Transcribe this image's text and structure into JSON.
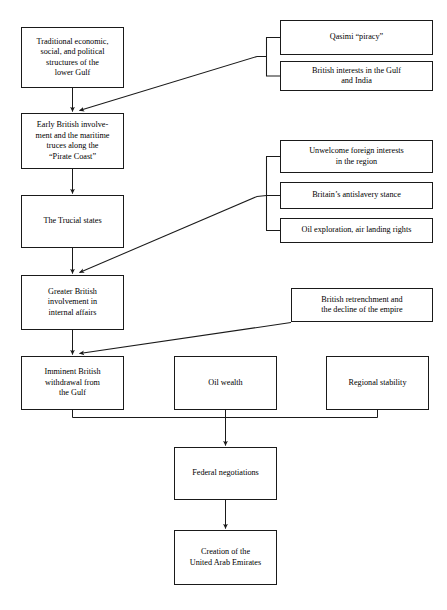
{
  "diagram": {
    "type": "flowchart",
    "background_color": "#ffffff",
    "line_color": "#1a1a1a",
    "text_color": "#000000",
    "nodes": [
      {
        "id": "traditional-structures",
        "label": "Traditional economic,\nsocial, and political\nstructures of the\nlower Gulf",
        "x": 21,
        "y": 27,
        "w": 103,
        "h": 61
      },
      {
        "id": "qasimi-piracy",
        "label": "Qasimi “piracy”",
        "x": 280,
        "y": 20,
        "w": 153,
        "h": 35
      },
      {
        "id": "british-interests",
        "label": "British interests in the Gulf\nand India",
        "x": 280,
        "y": 61,
        "w": 153,
        "h": 30
      },
      {
        "id": "early-british-involvement",
        "label": "Early British involve-\nment and the maritime\ntruces along the\n“Pirate Coast”",
        "x": 21,
        "y": 113,
        "w": 103,
        "h": 56
      },
      {
        "id": "unwelcome-foreign-interests",
        "label": "Unwelcome foreign interests\nin the region",
        "x": 280,
        "y": 140,
        "w": 153,
        "h": 33
      },
      {
        "id": "britain-antislavery",
        "label": "Britain’s antislavery stance",
        "x": 280,
        "y": 182,
        "w": 153,
        "h": 27
      },
      {
        "id": "oil-exploration",
        "label": "Oil exploration, air landing rights",
        "x": 280,
        "y": 218,
        "w": 153,
        "h": 25
      },
      {
        "id": "trucial-states",
        "label": "The Trucial states",
        "x": 21,
        "y": 195,
        "w": 103,
        "h": 53
      },
      {
        "id": "greater-british-involvement",
        "label": "Greater British\ninvolvement in\ninternal affairs",
        "x": 21,
        "y": 275,
        "w": 103,
        "h": 55
      },
      {
        "id": "british-retrenchment",
        "label": "British retrenchment and\nthe decline of the empire",
        "x": 291,
        "y": 288,
        "w": 142,
        "h": 34
      },
      {
        "id": "imminent-withdrawal",
        "label": "Imminent British\nwithdrawal from\nthe Gulf",
        "x": 21,
        "y": 356,
        "w": 103,
        "h": 54
      },
      {
        "id": "oil-wealth",
        "label": "Oil wealth",
        "x": 174,
        "y": 356,
        "w": 103,
        "h": 54
      },
      {
        "id": "regional-stability",
        "label": "Regional stability",
        "x": 326,
        "y": 356,
        "w": 103,
        "h": 54
      },
      {
        "id": "federal-negotiations",
        "label": "Federal negotiations",
        "x": 174,
        "y": 447,
        "w": 103,
        "h": 53
      },
      {
        "id": "creation-uae",
        "label": "Creation of the\nUnited Arab Emirates",
        "x": 174,
        "y": 530,
        "w": 103,
        "h": 55
      }
    ],
    "edges": [
      {
        "id": "traditional-to-early",
        "kind": "vertical-arrow",
        "from": "traditional-structures",
        "to": "early-british-involvement"
      },
      {
        "id": "qasimi-group-to-early",
        "kind": "bracket-diagonal-arrow",
        "from": "qasimi-piracy,british-interests",
        "to": "early-british-involvement"
      },
      {
        "id": "early-to-trucial",
        "kind": "vertical-arrow",
        "from": "early-british-involvement",
        "to": "trucial-states"
      },
      {
        "id": "trucial-to-greater",
        "kind": "vertical-arrow",
        "from": "trucial-states",
        "to": "greater-british-involvement"
      },
      {
        "id": "interests-group-to-greater",
        "kind": "bracket-diagonal-arrow",
        "from": "unwelcome-foreign-interests,britain-antislavery,oil-exploration",
        "to": "greater-british-involvement"
      },
      {
        "id": "greater-to-imminent",
        "kind": "vertical-arrow",
        "from": "greater-british-involvement",
        "to": "imminent-withdrawal"
      },
      {
        "id": "retrenchment-to-imminent",
        "kind": "diagonal-arrow",
        "from": "british-retrenchment",
        "to": "imminent-withdrawal"
      },
      {
        "id": "three-to-federal",
        "kind": "merge-arrow",
        "from": "imminent-withdrawal,oil-wealth,regional-stability",
        "to": "federal-negotiations"
      },
      {
        "id": "federal-to-creation",
        "kind": "vertical-arrow",
        "from": "federal-negotiations",
        "to": "creation-uae"
      }
    ]
  }
}
